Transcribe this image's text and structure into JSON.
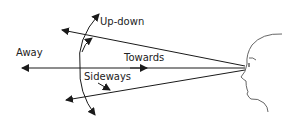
{
  "diagram": {
    "labels": {
      "away": "Away",
      "towards": "Towards",
      "up_down": "Up-down",
      "sideways": "Sideways"
    },
    "colors": {
      "line": "#1a1a1a",
      "face": "#555555",
      "text": "#222222"
    },
    "elements": {
      "arrows": [
        "away-towards-axis",
        "upper-sight-line",
        "lower-sight-line",
        "up-down-arc",
        "sideways-arrow",
        "up-arrow"
      ],
      "figure": "head-profile"
    }
  }
}
